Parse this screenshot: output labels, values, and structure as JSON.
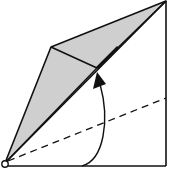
{
  "diagram": {
    "type": "origami-fold-step",
    "colors": {
      "background": "#ffffff",
      "stroke": "#111111",
      "fill_shaded": "#cfcfcf"
    },
    "elements": {
      "square_outline": "square paper edges (bottom and right)",
      "shaded_flap": "kite-shaped folded flap",
      "crease_line": "inner crease across flap",
      "dashed_fold_line": "valley fold line",
      "fold_arrow": "curved arrow indicating fold direction",
      "pivot_point": "circle marking corner reference point"
    }
  }
}
